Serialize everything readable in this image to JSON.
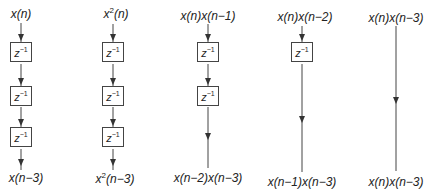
{
  "diagram": {
    "type": "delay-line-block-diagrams",
    "delay_label": "z",
    "delay_exponent": "−1",
    "columns": [
      {
        "input": "x(n)",
        "output": "x(n−3)",
        "delays": 3
      },
      {
        "input": "x²(n)",
        "output": "x²(n−3)",
        "delays": 3
      },
      {
        "input": "x(n)x(n−1)",
        "output": "x(n−2)x(n−3)",
        "delays": 2
      },
      {
        "input": "x(n)x(n−2)",
        "output": "x(n−1)x(n−3)",
        "delays": 1
      },
      {
        "input": "x(n)x(n−3)",
        "output": "x(n)x(n−3)",
        "delays": 0
      }
    ],
    "col1": {
      "in_base": "x(",
      "in_var": "n",
      "in_close": ")",
      "out_a": "x(",
      "out_b": "n",
      "out_c": "−3)"
    },
    "col2": {
      "in_base": "x",
      "in_sup": "2",
      "in_rest": "(n)",
      "out_base": "x",
      "out_sup": "2",
      "out_rest": "(n−3)"
    },
    "col3": {
      "in": "x(n)x(n−1)",
      "out": "x(n−2)x(n−3)"
    },
    "col4": {
      "in": "x(n)x(n−2)",
      "out": "x(n−1)x(n−3)"
    },
    "col5": {
      "in": "x(n)x(n−3)",
      "out": "x(n)x(n−3)"
    }
  }
}
